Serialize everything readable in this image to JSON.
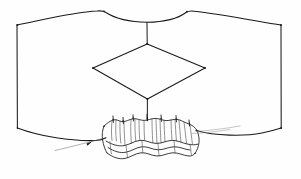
{
  "figure": {
    "title": "Hand-drawn line diagram",
    "background_color": "#fefefe",
    "ink_color": "#1a1a1a",
    "hatch_color": "#4a4a4a",
    "leader_color": "#707070",
    "width": 301,
    "height": 179
  },
  "parts": {
    "sheet": {
      "label": "outer-sheet",
      "corners": [
        {
          "name": "top-left",
          "x": 17,
          "y": 25
        },
        {
          "name": "top-right",
          "x": 281,
          "y": 25
        },
        {
          "name": "bottom-right",
          "x": 281,
          "y": 128
        },
        {
          "name": "bottom-left",
          "x": 17,
          "y": 128
        }
      ],
      "top_edge_peaks": [
        {
          "x": 105,
          "y": 11
        },
        {
          "x": 187,
          "y": 12
        }
      ],
      "top_edge_dip": {
        "x": 147,
        "y": 22
      },
      "bottom_edge_dip": {
        "x": 147,
        "y": 120
      }
    },
    "diamond": {
      "label": "centre-diamond",
      "vertices": [
        {
          "name": "top",
          "x": 147,
          "y": 44
        },
        {
          "name": "right",
          "x": 205,
          "y": 68
        },
        {
          "name": "bottom",
          "x": 147,
          "y": 99
        },
        {
          "name": "left",
          "x": 93,
          "y": 68
        }
      ]
    },
    "connectors": [
      {
        "label": "upper-connector",
        "x": 147,
        "y1": 22,
        "y2": 44
      },
      {
        "label": "lower-connector",
        "x": 147,
        "y1": 99,
        "y2": 120
      }
    ],
    "pleat": {
      "label": "pleated-corrugated-band",
      "left_x": 103,
      "right_x": 200,
      "top_y": 118,
      "bottom_y": 162,
      "crest_count": 5,
      "tick_count": 7
    },
    "leader": {
      "label": "leader-arrow",
      "start": {
        "x": 55,
        "y": 150
      },
      "arrow_tip": {
        "x": 92,
        "y": 141
      },
      "right_tail_start": {
        "x": 196,
        "y": 131
      },
      "right_tail_end": {
        "x": 238,
        "y": 126
      }
    }
  }
}
